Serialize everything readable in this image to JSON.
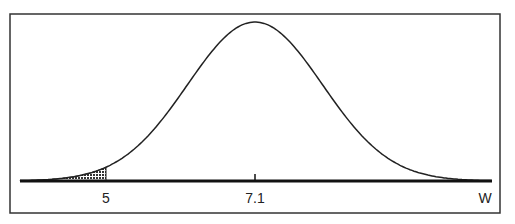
{
  "diagram": {
    "type": "normal-distribution-curve",
    "mean_label": "7.1",
    "cutoff_label": "5",
    "axis_label": "W",
    "mean": 7.1,
    "cutoff": 5,
    "sd_estimate": 0.95,
    "shaded_region": "left tail, W < 5",
    "colors": {
      "line": "#222222",
      "shade": "#555555",
      "frame": "#333333",
      "background": "#ffffff"
    }
  }
}
